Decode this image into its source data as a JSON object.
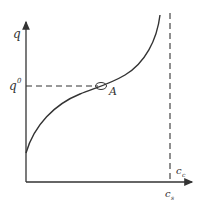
{
  "diagram": {
    "type": "isotherm-curve",
    "axes": {
      "y_label": "q",
      "x_label": "c",
      "x_label_sub": "s"
    },
    "reference": {
      "q0_label": "q",
      "q0_sup": "0",
      "cc_label": "c",
      "cc_sub": "c"
    },
    "point": {
      "label": "A"
    },
    "colors": {
      "line": "#333333",
      "background": "#ffffff"
    }
  }
}
